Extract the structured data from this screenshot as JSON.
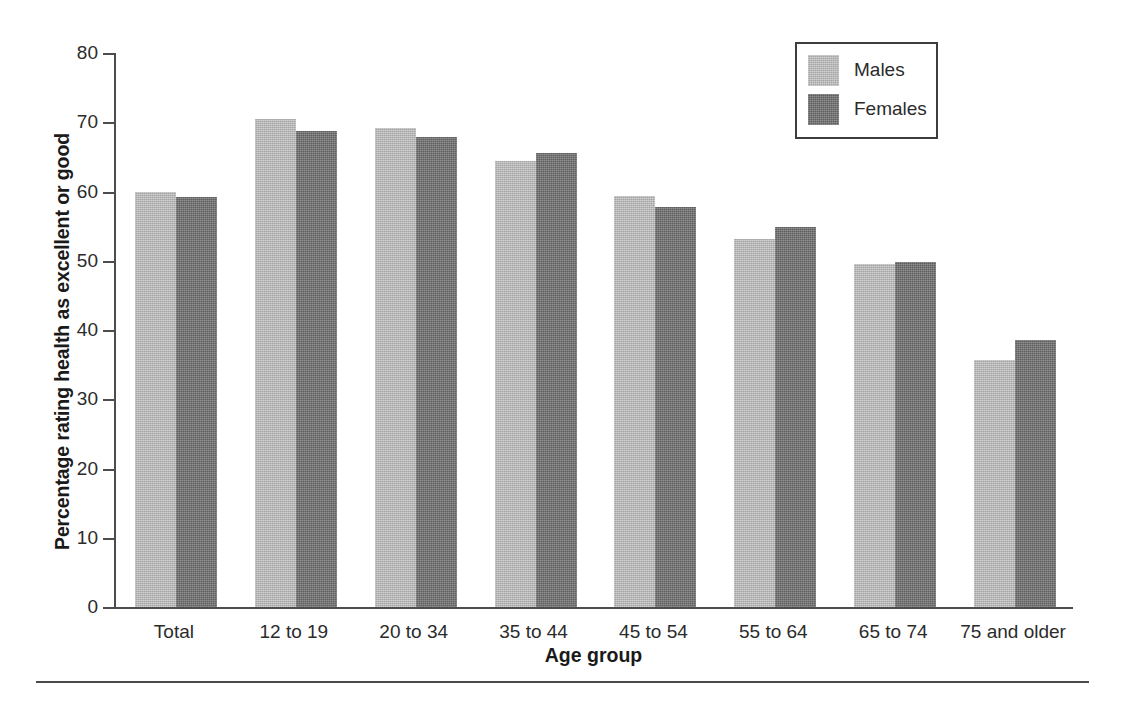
{
  "chart_data": {
    "type": "bar",
    "title": "",
    "xlabel": "Age group",
    "ylabel": "Percentage rating health as excellent or good",
    "ylim": [
      0,
      80
    ],
    "ytick_step": 10,
    "yticks": [
      80,
      70,
      60,
      50,
      40,
      30,
      20,
      10,
      0
    ],
    "grid": false,
    "legend_position": "top-right",
    "categories": [
      "Total",
      "12 to 19",
      "20 to 34",
      "35 to 44",
      "45 to 54",
      "55 to 64",
      "65 to 74",
      "75 and older"
    ],
    "series": [
      {
        "name": "Males",
        "color": "#b5b5b5",
        "values": [
          60.0,
          70.4,
          69.2,
          64.4,
          59.4,
          53.1,
          49.5,
          35.6
        ]
      },
      {
        "name": "Females",
        "color": "#6b6b6b",
        "values": [
          59.2,
          68.7,
          67.9,
          65.5,
          57.7,
          54.9,
          49.8,
          38.6
        ]
      }
    ]
  },
  "axes": {
    "y_title": "Percentage rating health as excellent or good",
    "x_title": "Age group",
    "y_tick_labels": [
      "80",
      "70",
      "60",
      "50",
      "40",
      "30",
      "20",
      "10",
      "0"
    ],
    "x_tick_labels": [
      "Total",
      "12 to 19",
      "20 to 34",
      "35 to 44",
      "45 to 54",
      "55 to 64",
      "65 to 74",
      "75 and older"
    ]
  },
  "legend": {
    "items": [
      {
        "label": "Males",
        "color": "#b5b5b5"
      },
      {
        "label": "Females",
        "color": "#6b6b6b"
      }
    ]
  },
  "colors": {
    "males": "#b5b5b5",
    "females": "#6b6b6b",
    "axis": "#4d4d4d",
    "text": "#1a1a1a",
    "background": "#ffffff"
  }
}
